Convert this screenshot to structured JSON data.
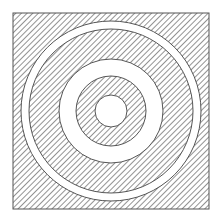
{
  "figure": {
    "square": {
      "x": 13,
      "y": 13,
      "size": 196
    },
    "center": {
      "cx": 111,
      "cy": 111
    },
    "rings": [
      {
        "name": "outer-white-ring",
        "r_outer": 90,
        "r_inner": 82,
        "fill": "white"
      },
      {
        "name": "middle-hatched-ring",
        "r_outer": 82,
        "r_inner": 52,
        "fill": "hatch"
      },
      {
        "name": "middle-white-ring",
        "r_outer": 52,
        "r_inner": 35,
        "fill": "white"
      },
      {
        "name": "inner-hatched-ring",
        "r_outer": 35,
        "r_inner": 16,
        "fill": "hatch"
      },
      {
        "name": "center-white-disc",
        "r_outer": 16,
        "r_inner": 0,
        "fill": "white"
      }
    ],
    "colors": {
      "stroke": "#555555",
      "hatch": "#777777",
      "background": "#ffffff"
    }
  }
}
